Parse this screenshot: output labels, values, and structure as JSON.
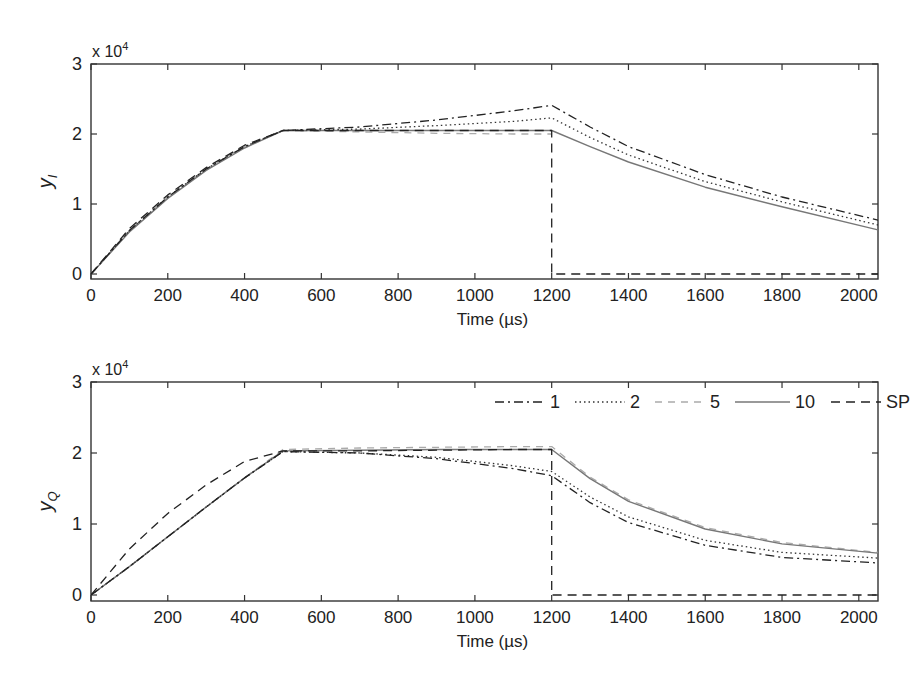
{
  "chart_data": [
    {
      "type": "line",
      "id": "top",
      "title": "",
      "xlabel": "Time (µs)",
      "ylabel": "y_I",
      "ylabel_main": "y",
      "ylabel_sub": "I",
      "y_multiplier": "x 10",
      "y_multiplier_exp": "4",
      "xlim": [
        0,
        2050
      ],
      "ylim": [
        0,
        3
      ],
      "xticks": [
        0,
        200,
        400,
        600,
        800,
        1000,
        1200,
        1400,
        1600,
        1800,
        2000
      ],
      "yticks": [
        0,
        1,
        2,
        3
      ],
      "grid": false,
      "legend": null,
      "series": [
        {
          "name": "1",
          "style": "dashdot",
          "color": "#222222",
          "x": [
            0,
            100,
            200,
            300,
            400,
            500,
            700,
            900,
            1100,
            1200,
            1300,
            1400,
            1600,
            1800,
            2050
          ],
          "y": [
            0,
            0.62,
            1.1,
            1.5,
            1.82,
            2.05,
            2.1,
            2.2,
            2.33,
            2.41,
            2.1,
            1.82,
            1.42,
            1.1,
            0.77
          ]
        },
        {
          "name": "2",
          "style": "dotted",
          "color": "#333333",
          "x": [
            0,
            100,
            200,
            300,
            400,
            500,
            700,
            900,
            1100,
            1200,
            1300,
            1400,
            1600,
            1800,
            2050
          ],
          "y": [
            0,
            0.62,
            1.1,
            1.5,
            1.82,
            2.05,
            2.07,
            2.12,
            2.18,
            2.23,
            1.95,
            1.7,
            1.32,
            1.03,
            0.7
          ]
        },
        {
          "name": "5",
          "style": "dashed-light",
          "color": "#aaaaaa",
          "x": [
            0,
            100,
            200,
            300,
            400,
            500,
            700,
            900,
            1100,
            1200
          ],
          "y": [
            0,
            0.62,
            1.1,
            1.5,
            1.82,
            2.05,
            2.03,
            2.01,
            2.0,
            2.0
          ]
        },
        {
          "name": "10",
          "style": "solid",
          "color": "#777777",
          "x": [
            0,
            100,
            200,
            300,
            400,
            500,
            700,
            900,
            1100,
            1200,
            1300,
            1400,
            1600,
            1800,
            2050
          ],
          "y": [
            0,
            0.6,
            1.08,
            1.48,
            1.8,
            2.05,
            2.05,
            2.05,
            2.05,
            2.05,
            1.82,
            1.6,
            1.24,
            0.96,
            0.63
          ]
        },
        {
          "name": "SP",
          "style": "dashed",
          "color": "#222222",
          "x": [
            0,
            100,
            200,
            300,
            400,
            500,
            700,
            900,
            1100,
            1200,
            1200,
            1210,
            2050
          ],
          "y": [
            0,
            0.65,
            1.13,
            1.52,
            1.84,
            2.05,
            2.05,
            2.05,
            2.05,
            2.05,
            0.0,
            0.0,
            0.0
          ]
        }
      ]
    },
    {
      "type": "line",
      "id": "bottom",
      "title": "",
      "xlabel": "Time (µs)",
      "ylabel": "y_Q",
      "ylabel_main": "y",
      "ylabel_sub": "Q",
      "y_multiplier": "x 10",
      "y_multiplier_exp": "4",
      "xlim": [
        0,
        2050
      ],
      "ylim": [
        0,
        3
      ],
      "xticks": [
        0,
        200,
        400,
        600,
        800,
        1000,
        1200,
        1400,
        1600,
        1800,
        2000
      ],
      "yticks": [
        0,
        1,
        2,
        3
      ],
      "grid": false,
      "legend": {
        "position": "upper right",
        "orientation": "horizontal",
        "entries": [
          "1",
          "2",
          "5",
          "10",
          "SP"
        ]
      },
      "series": [
        {
          "name": "1",
          "style": "dashdot",
          "color": "#222222",
          "x": [
            0,
            100,
            200,
            300,
            400,
            500,
            700,
            900,
            1000,
            1100,
            1200,
            1300,
            1400,
            1600,
            1800,
            2050
          ],
          "y": [
            0,
            0.4,
            0.82,
            1.24,
            1.65,
            2.02,
            2.0,
            1.92,
            1.85,
            1.78,
            1.68,
            1.3,
            1.02,
            0.7,
            0.53,
            0.45
          ]
        },
        {
          "name": "2",
          "style": "dotted",
          "color": "#333333",
          "x": [
            0,
            100,
            200,
            300,
            400,
            500,
            700,
            900,
            1000,
            1100,
            1200,
            1300,
            1400,
            1600,
            1800,
            2050
          ],
          "y": [
            0,
            0.4,
            0.82,
            1.24,
            1.65,
            2.02,
            2.0,
            1.94,
            1.88,
            1.82,
            1.74,
            1.38,
            1.1,
            0.77,
            0.6,
            0.52
          ]
        },
        {
          "name": "5",
          "style": "dashed-light",
          "color": "#aaaaaa",
          "x": [
            0,
            100,
            200,
            300,
            400,
            500,
            700,
            900,
            1100,
            1200,
            1300,
            1400,
            1600,
            1800,
            2050
          ],
          "y": [
            0,
            0.4,
            0.82,
            1.24,
            1.65,
            2.05,
            2.07,
            2.08,
            2.09,
            2.09,
            1.66,
            1.34,
            0.95,
            0.74,
            0.6
          ]
        },
        {
          "name": "10",
          "style": "solid",
          "color": "#777777",
          "x": [
            0,
            100,
            200,
            300,
            400,
            500,
            700,
            900,
            1100,
            1200,
            1300,
            1400,
            1600,
            1800,
            2050
          ],
          "y": [
            0,
            0.4,
            0.82,
            1.24,
            1.65,
            2.03,
            2.04,
            2.05,
            2.05,
            2.05,
            1.64,
            1.32,
            0.93,
            0.72,
            0.59
          ]
        },
        {
          "name": "SP",
          "style": "dashed",
          "color": "#222222",
          "x": [
            0,
            100,
            200,
            300,
            400,
            500,
            700,
            900,
            1100,
            1200,
            1200,
            1210,
            2050
          ],
          "y": [
            0,
            0.65,
            1.15,
            1.55,
            1.88,
            2.03,
            2.03,
            2.04,
            2.05,
            2.05,
            0.0,
            0.0,
            0.0
          ]
        }
      ]
    }
  ],
  "figure": {
    "panels": [
      {
        "id": "top",
        "left": 91,
        "top": 64,
        "right": 878,
        "bottom": 279,
        "y0px": 274
      },
      {
        "id": "bottom",
        "left": 91,
        "top": 382,
        "right": 878,
        "bottom": 601,
        "y0px": 595
      }
    ]
  }
}
